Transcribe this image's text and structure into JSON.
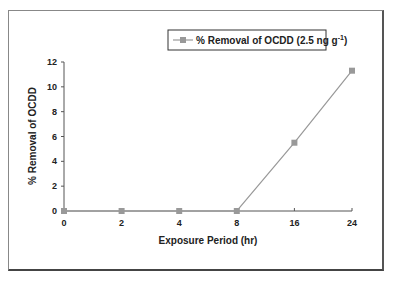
{
  "chart_data": {
    "type": "line",
    "title": "",
    "xlabel": "Exposure Period (hr)",
    "ylabel": "% Removal of OCDD",
    "categories": [
      "0",
      "2",
      "4",
      "8",
      "16",
      "24"
    ],
    "series": [
      {
        "name": "% Removal of OCDD (2.5 ng g-1)",
        "values": [
          0,
          0,
          0,
          0,
          5.5,
          11.3
        ],
        "color": "#999999",
        "marker": "square"
      }
    ],
    "yticks": [
      "0",
      "2",
      "4",
      "6",
      "8",
      "10",
      "12"
    ],
    "ylim": [
      0,
      12
    ],
    "grid": false,
    "legend_position": "top-center, boxed"
  },
  "legend": {
    "label_main": "% Removal of OCDD (2.5 ng g",
    "label_sup": "-1",
    "label_end": ")"
  },
  "axes": {
    "x_title": "Exposure Period (hr)",
    "y_title": "% Removal of OCDD"
  },
  "colors": {
    "series_line": "#999999",
    "axis": "#555555",
    "text": "#222222"
  }
}
